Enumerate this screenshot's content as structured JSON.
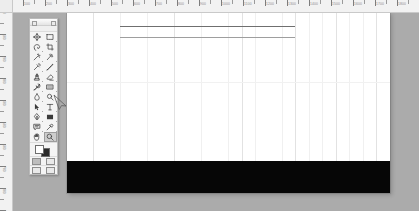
{
  "app": {
    "title": "Image Editor",
    "canvas_background": "#ffffff",
    "workspace_background": "#ababab",
    "ruler_background": "#f2f2f2"
  },
  "rulers": {
    "horizontal": {
      "unit_label": "px",
      "labels": [
        "0",
        "100",
        "200",
        "300",
        "400",
        "500",
        "600",
        "700",
        "800",
        "900",
        "1000",
        "1100",
        "1200",
        "1300",
        "1400",
        "1500",
        "1600",
        "1700",
        "1800"
      ],
      "tick_spacing_px": 22,
      "origin_x_px": 67
    },
    "vertical": {
      "unit_label": "px",
      "labels": [
        "0",
        "100",
        "200",
        "300",
        "400",
        "500",
        "600",
        "700",
        "800",
        "900"
      ],
      "tick_spacing_px": 22,
      "origin_y_px": 12
    }
  },
  "canvas": {
    "left": 67,
    "top": 12,
    "width": 323,
    "height": 181,
    "rules": [
      {
        "name": "upper-rule",
        "x": 53,
        "y": 14,
        "width": 175,
        "color": "#6f6f6f",
        "thickness": 1
      },
      {
        "name": "lower-rule",
        "x": 53,
        "y": 25,
        "width": 175,
        "color": "#9e9e9e",
        "thickness": 1
      }
    ],
    "black_band": {
      "name": "black-fill-band",
      "top": 149,
      "height": 33,
      "color": "#060606"
    },
    "horizontal_guide_y": 70,
    "vertical_guides_x": [
      26,
      53,
      80,
      107,
      134,
      161,
      175,
      188,
      215,
      228,
      242,
      255,
      269,
      282,
      296,
      309
    ]
  },
  "palette": {
    "title": "Tools",
    "selected_tool": "zoom-tool",
    "tools": [
      {
        "name": "move-tool",
        "label": "Move",
        "has_flyout": false
      },
      {
        "name": "marquee-tool",
        "label": "Rectangular Marquee",
        "has_flyout": true
      },
      {
        "name": "lasso-tool",
        "label": "Lasso",
        "has_flyout": true
      },
      {
        "name": "crop-tool",
        "label": "Crop",
        "has_flyout": false
      },
      {
        "name": "magic-wand-tool",
        "label": "Magic Wand",
        "has_flyout": true
      },
      {
        "name": "slice-tool",
        "label": "Slice",
        "has_flyout": true
      },
      {
        "name": "healing-brush-tool",
        "label": "Healing Brush",
        "has_flyout": true
      },
      {
        "name": "brush-tool",
        "label": "Brush",
        "has_flyout": true
      },
      {
        "name": "clone-stamp-tool",
        "label": "Clone Stamp",
        "has_flyout": true
      },
      {
        "name": "eraser-tool",
        "label": "Eraser",
        "has_flyout": true
      },
      {
        "name": "history-brush-tool",
        "label": "History Brush",
        "has_flyout": true
      },
      {
        "name": "gradient-tool",
        "label": "Gradient",
        "has_flyout": true
      },
      {
        "name": "blur-tool",
        "label": "Blur",
        "has_flyout": true
      },
      {
        "name": "dodge-tool",
        "label": "Dodge",
        "has_flyout": true
      },
      {
        "name": "path-selection-tool",
        "label": "Path Selection",
        "has_flyout": true
      },
      {
        "name": "type-tool",
        "label": "Horizontal Type",
        "has_flyout": true
      },
      {
        "name": "pen-tool",
        "label": "Pen",
        "has_flyout": true
      },
      {
        "name": "shape-tool",
        "label": "Rectangle Shape",
        "has_flyout": true
      },
      {
        "name": "notes-tool",
        "label": "Notes",
        "has_flyout": true
      },
      {
        "name": "eyedropper-tool",
        "label": "Eyedropper",
        "has_flyout": true
      },
      {
        "name": "hand-tool",
        "label": "Hand",
        "has_flyout": false
      },
      {
        "name": "zoom-tool",
        "label": "Zoom",
        "has_flyout": false
      }
    ],
    "colors": {
      "foreground": "#ffffff",
      "background": "#2a2a2a"
    },
    "screen_modes": [
      "standard-screen-mode",
      "full-screen-with-menubar",
      "full-screen-mode"
    ],
    "edit_modes": [
      "standard-mode",
      "quick-mask-mode"
    ]
  },
  "cursor": {
    "name": "arrow-pointer",
    "x": 52,
    "y": 93
  }
}
